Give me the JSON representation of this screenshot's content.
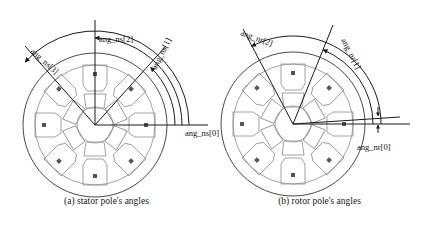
{
  "figure": {
    "type": "technical-diagram",
    "panels": [
      {
        "id": "a",
        "caption": "(a) stator pole's angles",
        "center": [
          95,
          125
        ],
        "labels": [
          {
            "key": "ang_ns_0",
            "text": "ang_ns[0]"
          },
          {
            "key": "ang_ns_1",
            "text": "ang_ns[1]"
          },
          {
            "key": "ang_ns_2",
            "text": "ang_ns[2]"
          },
          {
            "key": "ang_ns_3",
            "text": "ang_ns[3]"
          }
        ],
        "stator_poles": 8,
        "rotor_poles": 6,
        "radial_angles_deg": [
          0,
          48,
          90,
          138
        ],
        "arc_radii": [
          80,
          87,
          94
        ]
      },
      {
        "id": "b",
        "caption": "(b) rotor pole's angles",
        "center": [
          293,
          124
        ],
        "labels": [
          {
            "key": "ang_nr_0",
            "text": "ang_nr[0]"
          },
          {
            "key": "ang_nr_1",
            "text": "ang_nr[1]"
          },
          {
            "key": "ang_nr_2",
            "text": "ang_nr[2]"
          }
        ],
        "stator_poles": 8,
        "rotor_poles": 6,
        "radial_angles_deg": [
          4,
          68,
          118
        ],
        "arc_radii": [
          80,
          88
        ]
      }
    ],
    "colors": {
      "outline": "#1a1a1a",
      "machine": "#6b6b6b",
      "background": "#ffffff",
      "marker": "#555555"
    }
  }
}
